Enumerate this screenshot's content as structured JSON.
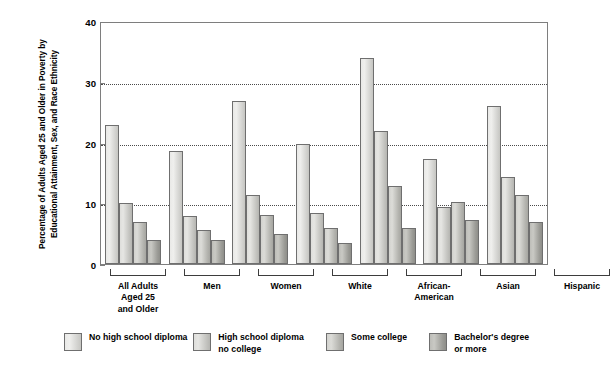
{
  "chart_data": {
    "type": "bar",
    "title": "",
    "subtitle": "",
    "xlabel": "",
    "ylabel": "Percentage of Adults Aged 25 and Older in Poverty by Educational Attainment, Sex, and Race Ethnicity",
    "ylim": [
      0,
      40
    ],
    "yticks": [
      0,
      10,
      20,
      30,
      40
    ],
    "ytick_labels": [
      "0",
      "10",
      "20",
      "30",
      "40"
    ],
    "grid": "horizontal-dotted",
    "gridlines_at": [
      10,
      20,
      30
    ],
    "legend_position": "bottom",
    "categories": [
      "All Adults\nAged 25\nand Older",
      "Men",
      "Women",
      "White",
      "African-\nAmerican",
      "Asian",
      "Hispanic"
    ],
    "series": [
      {
        "name": "No high school diploma",
        "color": "#e9e9e7",
        "values": [
          23.0,
          18.7,
          27.0,
          20.0,
          34.2,
          17.5,
          26.3
        ]
      },
      {
        "name": "High school diploma\nno college",
        "color": "#dededb",
        "values": [
          10.2,
          8.0,
          11.5,
          8.5,
          22.0,
          9.5,
          14.4
        ]
      },
      {
        "name": "Some college",
        "color": "#d2d2ce",
        "values": [
          7.0,
          5.7,
          8.2,
          6.0,
          13.0,
          10.3,
          11.5
        ]
      },
      {
        "name": "Bachelor's degree\nor more",
        "color": "#bdbdb8",
        "values": [
          4.0,
          4.0,
          5.0,
          3.5,
          6.0,
          7.3,
          7.0
        ]
      }
    ]
  }
}
